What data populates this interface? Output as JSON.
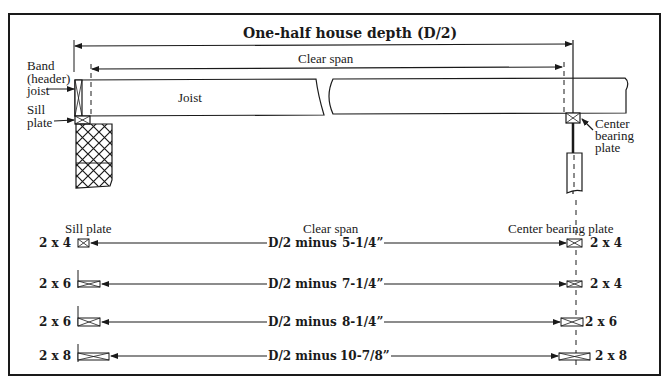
{
  "top_diagram": {
    "title": "One-half house depth (D/2)",
    "clear_span": "Clear span",
    "joist": "Joist",
    "band_joist": [
      "Band",
      "(header)",
      "joist"
    ],
    "sill_plate": [
      "Sill",
      "plate"
    ],
    "center_bearing_plate": [
      "Center",
      "bearing",
      "plate"
    ]
  },
  "table": {
    "headers": {
      "sill_plate": "Sill plate",
      "clear_span": "Clear span",
      "center_bearing_plate": "Center bearing plate"
    },
    "rows": [
      {
        "sill": "2 x 4",
        "prefix": "D/2 minus",
        "value": "5-1/4”",
        "center": "2 x 4"
      },
      {
        "sill": "2 x 6",
        "prefix": "D/2 minus",
        "value": "7-1/4”",
        "center": "2 x 4"
      },
      {
        "sill": "2 x 6",
        "prefix": "D/2 minus",
        "value": "8-1/4”",
        "center": "2 x 6"
      },
      {
        "sill": "2 x 8",
        "prefix": "D/2 minus",
        "value": "10-7/8”",
        "center": "2 x 8"
      }
    ]
  },
  "colors": {
    "ink": "#1a1a1a",
    "background": "#ffffff"
  }
}
